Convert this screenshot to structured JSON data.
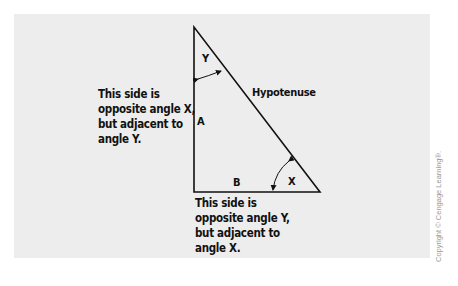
{
  "diagram": {
    "type": "right-triangle",
    "vertices": {
      "apex": [
        194,
        27
      ],
      "right_angle": [
        194,
        192
      ],
      "base_end": [
        320,
        192
      ]
    },
    "angle_labels": {
      "top": "Y",
      "bottom_right": "X"
    },
    "side_labels": {
      "vertical": "A",
      "horizontal": "B",
      "slanted": "Hypotenuse"
    },
    "notes": {
      "side_a": "This side is\nopposite angle X,\nbut adjacent to\nangle Y.",
      "side_b": "This side is\nopposite angle Y,\nbut adjacent to\nangle X."
    },
    "colors": {
      "background": "#ffffff",
      "panel": "#ededed",
      "stroke": "#111111",
      "copyright": "#9a9a9a"
    }
  },
  "copyright": "Copyright © Cengage Learning®."
}
